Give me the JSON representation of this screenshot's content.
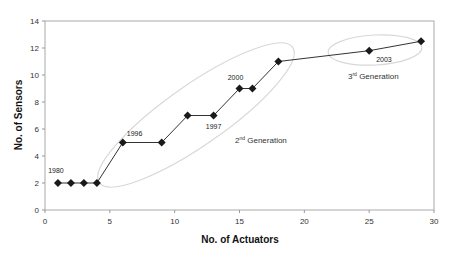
{
  "chart_data": {
    "type": "line",
    "title": "",
    "xlabel": "No. of Actuators",
    "ylabel": "No. of Sensors",
    "xlim": [
      0,
      30
    ],
    "ylim": [
      0,
      14
    ],
    "x_ticks": [
      0,
      5,
      10,
      15,
      20,
      25,
      30
    ],
    "y_ticks": [
      0,
      2,
      4,
      6,
      8,
      10,
      12,
      14
    ],
    "grid": false,
    "legend": null,
    "marker": "diamond",
    "series": [
      {
        "name": "Sensors vs Actuators",
        "x": [
          1,
          2,
          3,
          4,
          6,
          9,
          11,
          13,
          15,
          16,
          18,
          25,
          29
        ],
        "y": [
          2,
          2,
          2,
          2,
          5,
          5,
          7,
          7,
          9,
          9,
          11,
          11.8,
          12.5
        ]
      }
    ],
    "annotations": [
      {
        "text": "1980",
        "x": 1,
        "y": 2
      },
      {
        "text": "1996",
        "x": 6,
        "y": 5
      },
      {
        "text": "1997",
        "x": 13,
        "y": 7
      },
      {
        "text": "2000",
        "x": 15,
        "y": 9
      },
      {
        "text": "2003",
        "x": 25,
        "y": 11.8
      }
    ],
    "regions": [
      {
        "label_base": "2",
        "label_sup": "nd",
        "label_rest": " Generation"
      },
      {
        "label_base": "3",
        "label_sup": "rd",
        "label_rest": " Generation"
      }
    ]
  },
  "colors": {
    "line": "#333333",
    "marker": "#1a1a1a",
    "axis": "#999999",
    "ellipse": "#d4d4d4"
  }
}
